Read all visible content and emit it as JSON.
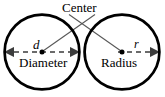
{
  "figure": {
    "colors": {
      "stroke": "#000000",
      "dashed_line": "#6b6b6b",
      "leader_line": "#5a5a5a",
      "background": "#ffffff",
      "text": "#000000"
    },
    "labels": {
      "center": "Center",
      "diameter": "Diameter",
      "radius": "Radius",
      "d_symbol": "d",
      "r_symbol": "r"
    },
    "circles": [
      {
        "name": "left-circle",
        "label": "Diameter",
        "symbol": "d",
        "cx": 42,
        "cy": 52,
        "r": 37.5,
        "stroke_width": 2.6
      },
      {
        "name": "right-circle",
        "label": "Radius",
        "symbol": "r",
        "cx": 122,
        "cy": 52,
        "r": 37.5,
        "stroke_width": 2.6
      }
    ],
    "measure_lines": [
      {
        "name": "diameter-line",
        "x1": 4.5,
        "y1": 52,
        "x2": 79.5,
        "y2": 52,
        "dash": "5 4",
        "arrows": "both"
      },
      {
        "name": "radius-line",
        "x1": 122,
        "y1": 52,
        "x2": 159.5,
        "y2": 52,
        "dash": "5 4",
        "arrows": "end"
      },
      {
        "name": "right-circle-left-tick",
        "x1": 84.5,
        "y1": 46,
        "x2": 84.5,
        "y2": 58
      }
    ],
    "leaders": [
      {
        "name": "leader-to-left-center",
        "x1": 95,
        "y1": 14,
        "x2": 42,
        "y2": 52
      },
      {
        "name": "leader-to-right-center",
        "x1": 69,
        "y1": 14,
        "x2": 122,
        "y2": 52
      }
    ],
    "center_dots": [
      {
        "name": "left-center-dot",
        "cx": 42,
        "cy": 52,
        "r": 2.4
      },
      {
        "name": "right-center-dot",
        "cx": 122,
        "cy": 52,
        "r": 2.4
      }
    ]
  }
}
